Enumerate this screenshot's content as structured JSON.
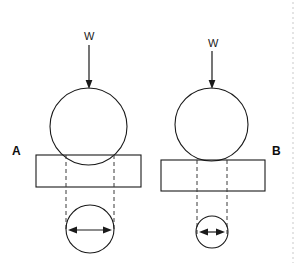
{
  "figure": {
    "background_color": "#ffffff",
    "line_color": "#1a1a1a",
    "dashed_line_color": "#3a3a3a",
    "width": 305,
    "height": 265
  },
  "panels": [
    {
      "id": "A",
      "label": "A",
      "load_label": "W",
      "load_arrow": {
        "x": 89,
        "y_start": 45,
        "y_end": 88
      },
      "sphere": {
        "cx": 88.5,
        "cy": 126.5,
        "r": 38.5
      },
      "block": {
        "x": 36,
        "y": 155,
        "width": 105,
        "height": 32
      },
      "projection_lines": [
        {
          "x": 66,
          "y_start": 155,
          "y_end": 231
        },
        {
          "x": 114,
          "y_start": 155,
          "y_end": 231
        }
      ],
      "contact_circle": {
        "cx": 90,
        "cy": 229,
        "r": 24
      },
      "contact_dimension_arrow": {
        "y": 230,
        "x_start": 68,
        "x_end": 112
      }
    },
    {
      "id": "B",
      "label": "B",
      "load_label": "W",
      "load_arrow": {
        "x": 212,
        "y_start": 51,
        "y_end": 88
      },
      "sphere": {
        "cx": 211.5,
        "cy": 124.5,
        "r": 36.5
      },
      "block": {
        "x": 161,
        "y": 160,
        "width": 104,
        "height": 31
      },
      "projection_lines": [
        {
          "x": 197,
          "y_start": 160,
          "y_end": 234
        },
        {
          "x": 227,
          "y_start": 160,
          "y_end": 234
        }
      ],
      "contact_circle": {
        "cx": 212,
        "cy": 232,
        "r": 16
      },
      "contact_dimension_arrow": {
        "y": 232,
        "x_start": 199,
        "x_end": 225
      }
    }
  ],
  "page_edge": {
    "x": 293,
    "y_start": 2,
    "y_end": 263
  }
}
